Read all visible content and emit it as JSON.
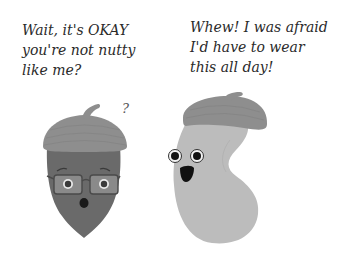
{
  "comic": {
    "left_character": {
      "name": "acorn",
      "speech": [
        "Wait, it's OKAY",
        "you're not nutty",
        "like me?"
      ],
      "thought_mark": "?",
      "accessories": [
        "acorn-cap",
        "glasses"
      ],
      "expression": "surprised",
      "colors": {
        "body": "#6a6a6a",
        "cap": "#8e8e8e",
        "glasses_lens": "#8a8a8a",
        "eye_white": "#e8e8e8",
        "pupil": "#1a1a1a"
      }
    },
    "right_character": {
      "name": "bean",
      "speech": [
        "Whew! I was afraid",
        "I'd have to wear",
        "this all day!"
      ],
      "accessories": [
        "acorn-cap"
      ],
      "expression": "happy",
      "colors": {
        "body": "#bcbcbc",
        "cap": "#8e8e8e",
        "eye_white": "#f2f2f2",
        "pupil": "#111111",
        "mouth": "#111111"
      }
    }
  }
}
